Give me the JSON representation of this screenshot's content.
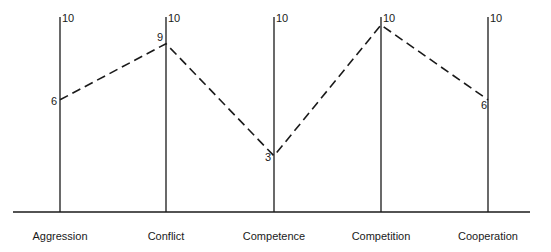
{
  "chart_data": {
    "type": "line",
    "title": "",
    "xlabel": "",
    "ylabel": "",
    "categories": [
      "Aggression",
      "Conflict",
      "Competence",
      "Competition",
      "Cooperation"
    ],
    "series": [
      {
        "name": "Profile",
        "values": [
          6,
          9,
          3,
          10,
          6
        ],
        "line_style": "dashed"
      }
    ],
    "axis_max_labels": [
      "10",
      "10",
      "10",
      "10",
      "10"
    ],
    "ylim": [
      0,
      10
    ],
    "grid": false,
    "legend": "none",
    "layout": "parallel vertical axes, one per category, each topped with max value 10"
  },
  "colors": {
    "ink": "#1a1a1a",
    "background": "#ffffff"
  }
}
